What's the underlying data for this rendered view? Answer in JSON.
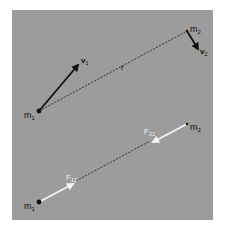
{
  "colors": {
    "panel": "#9c9c9c",
    "velocity_arrow": "#111111",
    "force_arrow": "#f4f4f4",
    "dashed_line": "#222222",
    "dot": "#111111",
    "label_dark": "#111111",
    "label_light": "#f4f4f4"
  },
  "top_panel": {
    "mass1_label": "m",
    "mass1_sub": "1",
    "mass2_label": "m",
    "mass2_sub": "2",
    "velocity1_label": "v",
    "velocity1_sub": "1",
    "velocity2_label": "v",
    "velocity2_sub": "2",
    "separation_label": "r"
  },
  "bottom_panel": {
    "mass1_label": "m",
    "mass1_sub": "1",
    "mass2_label": "m",
    "mass2_sub": "2",
    "force12_label": "F",
    "force12_sub": "12",
    "force21_label": "F",
    "force21_sub": "21"
  }
}
